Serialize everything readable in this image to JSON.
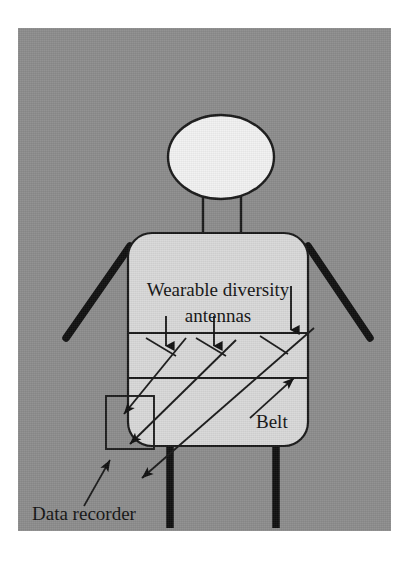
{
  "figure": {
    "type": "technical-diagram",
    "panel": {
      "background_color": "#8d8d8d",
      "page_background_color": "#ffffff",
      "x": 18,
      "y": 28,
      "width": 373,
      "height": 503
    },
    "labels": {
      "antennas_line1": "Wearable diversity",
      "antennas_line2": "antennas",
      "belt": "Belt",
      "data_recorder": "Data recorder"
    },
    "colors": {
      "body_fill": "#d9d9d9",
      "head_fill": "#f2f2f2",
      "outline": "#1a1a1a",
      "limb": "#111111",
      "text": "#141414",
      "panel": "#8d8d8d"
    },
    "parts": [
      {
        "name": "head",
        "shape": "ellipse",
        "cx": 203,
        "cy": 129,
        "rx": 53,
        "ry": 42
      },
      {
        "name": "neck",
        "shape": "rect",
        "x": 185,
        "y": 168,
        "width": 38,
        "height": 37
      },
      {
        "name": "torso",
        "shape": "rounded-rect",
        "x": 110,
        "y": 205,
        "width": 180,
        "height": 213,
        "radius": 24
      },
      {
        "name": "left-arm",
        "shape": "line",
        "x1": 112,
        "y1": 218,
        "x2": 48,
        "y2": 310
      },
      {
        "name": "right-arm",
        "shape": "line",
        "x1": 290,
        "y1": 218,
        "x2": 352,
        "y2": 310
      },
      {
        "name": "left-leg",
        "shape": "line",
        "x1": 152,
        "y1": 418,
        "x2": 152,
        "y2": 500
      },
      {
        "name": "right-leg",
        "shape": "line",
        "x1": 258,
        "y1": 418,
        "x2": 258,
        "y2": 500
      },
      {
        "name": "belt-band",
        "shape": "band",
        "top_y": 305,
        "bottom_y": 350,
        "left_x": 110,
        "right_x": 290
      },
      {
        "name": "data-recorder-box",
        "shape": "rect",
        "x": 88,
        "y": 368,
        "width": 48,
        "height": 53
      }
    ],
    "antennas": [
      {
        "index": 1,
        "x": 148,
        "y": 322
      },
      {
        "index": 2,
        "x": 196,
        "y": 322
      },
      {
        "index": 3,
        "x": 280,
        "y": 305
      }
    ],
    "cables": [
      {
        "from_antenna": 1,
        "to": "data-recorder",
        "x1": 152,
        "y1": 330,
        "x2": 110,
        "y2": 388
      },
      {
        "from_antenna": 2,
        "to": "data-recorder",
        "x1": 205,
        "y1": 330,
        "x2": 118,
        "y2": 418
      },
      {
        "from_antenna": 3,
        "to": "data-recorder",
        "x1": 290,
        "y1": 318,
        "x2": 128,
        "y2": 450
      }
    ],
    "leader_lines": [
      {
        "name": "belt-leader",
        "x1": 262,
        "y1": 400,
        "x2": 305,
        "y2": 358
      },
      {
        "name": "data-recorder-leader",
        "x1": 78,
        "y1": 495,
        "x2": 100,
        "y2": 448
      }
    ]
  }
}
